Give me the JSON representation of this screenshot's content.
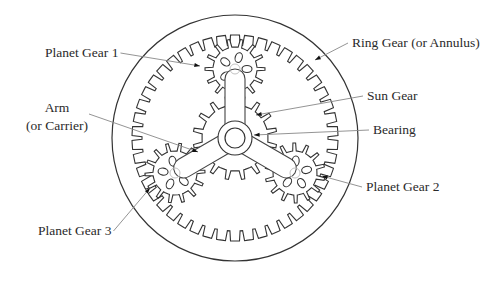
{
  "diagram": {
    "colors": {
      "line": "#333333",
      "leader": "#888888",
      "background": "#ffffff",
      "text": "#2a2a2a"
    },
    "labels": [
      {
        "id": "planet1",
        "text": "Planet Gear 1",
        "x": 45,
        "y": 57,
        "anchor": "start",
        "arrow_to": [
          200,
          66
        ]
      },
      {
        "id": "ring",
        "text": "Ring Gear (or Annulus)",
        "x": 352,
        "y": 47,
        "anchor": "start",
        "arrow_to": [
          315,
          60
        ]
      },
      {
        "id": "sun",
        "text": "Sun Gear",
        "x": 367,
        "y": 100,
        "anchor": "start",
        "arrow_to": [
          256,
          115
        ]
      },
      {
        "id": "bearing",
        "text": "Bearing",
        "x": 373,
        "y": 134,
        "anchor": "start",
        "arrow_to": [
          254,
          135
        ]
      },
      {
        "id": "arm1",
        "text": "Arm",
        "x": 57,
        "y": 112,
        "anchor": "middle",
        "arrow_to": [
          198,
          152
        ]
      },
      {
        "id": "arm2",
        "text": "(or Carrier)",
        "x": 57,
        "y": 130,
        "anchor": "middle"
      },
      {
        "id": "planet2",
        "text": "Planet Gear 2",
        "x": 366,
        "y": 191,
        "anchor": "start",
        "arrow_to": [
          322,
          176
        ]
      },
      {
        "id": "planet3",
        "text": "Planet Gear 3",
        "x": 38,
        "y": 235,
        "anchor": "start",
        "arrow_to": [
          150,
          188
        ]
      }
    ],
    "geometry": {
      "center": [
        235,
        138
      ],
      "ring_outer_radius": 123,
      "ring_gear": {
        "root_radius": 103,
        "tip_radius": 93,
        "teeth": 46
      },
      "sun_gear": {
        "root_radius": 33,
        "tip_radius": 42,
        "teeth": 16
      },
      "planet_gears": [
        {
          "name": "Planet Gear 1",
          "cx": 235,
          "cy": 69,
          "root": 22,
          "tip": 30,
          "teeth": 14
        },
        {
          "name": "Planet Gear 2",
          "cx": 295,
          "cy": 173,
          "root": 22,
          "tip": 30,
          "teeth": 14
        },
        {
          "name": "Planet Gear 3",
          "cx": 175,
          "cy": 173,
          "root": 22,
          "tip": 30,
          "teeth": 14
        }
      ],
      "bearing": {
        "outer": 17,
        "inner": 10
      }
    }
  }
}
